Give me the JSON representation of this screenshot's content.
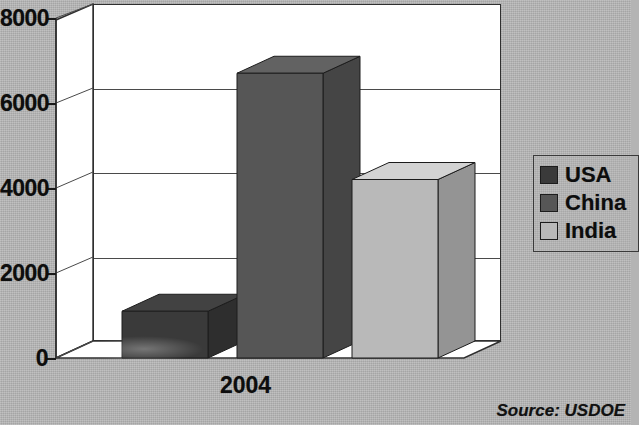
{
  "chart_data": {
    "type": "bar",
    "title": "",
    "subtitle": "",
    "xlabel": "",
    "ylabel": "",
    "categories": [
      "2004"
    ],
    "series": [
      {
        "name": "USA",
        "values": [
          1100
        ],
        "color": "#3a3a3a"
      },
      {
        "name": "China",
        "values": [
          6700
        ],
        "color": "#565656"
      },
      {
        "name": "India",
        "values": [
          4200
        ],
        "color": "#b9b9b9"
      }
    ],
    "ylim": [
      0,
      8000
    ],
    "yticks": [
      "0",
      "2000",
      "4000",
      "6000",
      "8000"
    ],
    "ytick_values": [
      0,
      2000,
      4000,
      6000,
      8000
    ],
    "grid": true,
    "three_d": true,
    "legend_position": "right",
    "annotations": [
      "Source: USDOE"
    ]
  },
  "legend": {
    "items": [
      {
        "label": "USA",
        "color": "#3a3a3a"
      },
      {
        "label": "China",
        "color": "#565656"
      },
      {
        "label": "India",
        "color": "#b9b9b9"
      }
    ]
  },
  "axis": {
    "y_ticks": [
      "8000",
      "6000",
      "4000",
      "2000",
      "0"
    ],
    "x_categories": [
      "2004"
    ]
  },
  "footer": {
    "source": "Source: USDOE"
  },
  "colors": {
    "background": "#b8b8b8",
    "plot_background": "#ffffff",
    "axis_line": "#2f2f2f",
    "grid_line": "#4a4a4a",
    "text": "#0d0d0d",
    "usa": "#3a3a3a",
    "china": "#565656",
    "india": "#b9b9b9"
  }
}
